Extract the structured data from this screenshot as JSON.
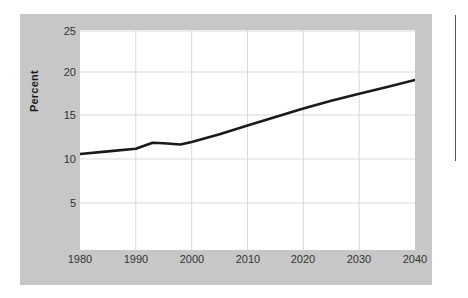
{
  "figure": {
    "panel_color": "#c7c7c7",
    "plot_background": "#ffffff",
    "grid_color": "#d9d9d9",
    "line_color": "#1a1a1a",
    "column_rule_color": "#555555"
  },
  "chart_data": {
    "type": "line",
    "title": "",
    "subtitle": "",
    "xlabel": "",
    "ylabel": "Percent",
    "xlim": [
      1980,
      2040
    ],
    "ylim": [
      0,
      26
    ],
    "grid": true,
    "legend": "none",
    "x_ticks": [
      1980,
      1990,
      2000,
      2010,
      2020,
      2030,
      2040
    ],
    "y_ticks": [
      5,
      10,
      15,
      20,
      25
    ],
    "x_tick_labels": [
      "1980",
      "1990",
      "2000",
      "2010",
      "2020",
      "2030",
      "2040"
    ],
    "y_tick_labels": [
      "5",
      "10",
      "15",
      "20",
      "25"
    ],
    "series": [
      {
        "name": "Percent",
        "x": [
          1980,
          1985,
          1990,
          1993,
          1995,
          1998,
          2000,
          2005,
          2010,
          2015,
          2020,
          2025,
          2030,
          2035,
          2040
        ],
        "values": [
          10.7,
          11.0,
          11.3,
          12.0,
          11.95,
          11.8,
          12.1,
          13.0,
          14.0,
          15.0,
          16.0,
          16.9,
          17.7,
          18.5,
          19.3
        ]
      }
    ]
  }
}
